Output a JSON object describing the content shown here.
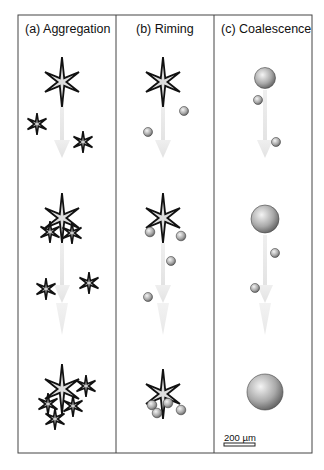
{
  "figure": {
    "panels": [
      {
        "id": "a",
        "title": "(a) Aggregation"
      },
      {
        "id": "b",
        "title": "(b) Riming"
      },
      {
        "id": "c",
        "title": "(c) Coalescence"
      }
    ],
    "scale_bar": {
      "label": "200 µm"
    },
    "colors": {
      "frame": "#444444",
      "arrow": "#e6e6e6",
      "star_fill": "#d8d8d8",
      "star_stroke": "#111111",
      "sphere_light": "#f2f2f2",
      "sphere_dark": "#6a6a6a"
    }
  }
}
